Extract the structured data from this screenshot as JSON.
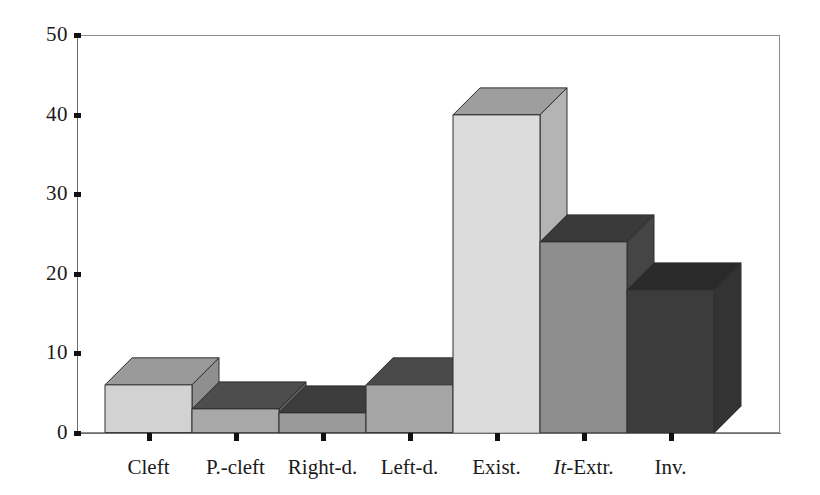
{
  "chart_data": {
    "type": "bar",
    "title": "",
    "subtitle": "",
    "xlabel": "",
    "ylabel": "",
    "ylim": [
      0,
      50
    ],
    "y_ticks": [
      0,
      10,
      20,
      30,
      40,
      50
    ],
    "grid": false,
    "legend": null,
    "style": "3d-block-bars",
    "categories": [
      "Cleft",
      "P.-cleft",
      "Right-d.",
      "Left-d.",
      "Exist.",
      "It-Extr.",
      "Inv."
    ],
    "values": [
      6,
      3,
      2.5,
      6,
      40,
      24,
      18
    ],
    "back_edge_values": [
      9.5,
      6,
      5.5,
      9.5,
      43,
      27,
      21
    ],
    "series": [
      {
        "name": "frequency",
        "values": [
          6,
          3,
          2.5,
          6,
          40,
          24,
          18
        ]
      }
    ],
    "bars": [
      {
        "label": "Cleft",
        "label_html": "Cleft",
        "value": 6,
        "back_value": 9.5,
        "front_color": "#d2d2d2",
        "top_color": "#9a9a9a",
        "side_color": "#8f8f8f"
      },
      {
        "label": "P.-cleft",
        "label_html": "P.-cleft",
        "value": 3,
        "back_value": 6,
        "front_color": "#a8a8a8",
        "top_color": "#4d4d4d",
        "side_color": "#5a5a5a"
      },
      {
        "label": "Right-d.",
        "label_html": "Right-d.",
        "value": 2.5,
        "back_value": 5.5,
        "front_color": "#9a9a9a",
        "top_color": "#3c3c3c",
        "side_color": "#4a4a4a"
      },
      {
        "label": "Left-d.",
        "label_html": "Left-d.",
        "value": 6,
        "back_value": 9.5,
        "front_color": "#a5a5a5",
        "top_color": "#4a4a4a",
        "side_color": "#585858"
      },
      {
        "label": "Exist.",
        "label_html": "Exist.",
        "value": 40,
        "back_value": 43,
        "front_color": "#dcdcdc",
        "top_color": "#9e9e9e",
        "side_color": "#b4b4b4"
      },
      {
        "label": "It-Extr.",
        "label_html": "<i>It</i>-Extr.",
        "value": 24,
        "back_value": 27,
        "front_color": "#8e8e8e",
        "top_color": "#3a3a3a",
        "side_color": "#454545"
      },
      {
        "label": "Inv.",
        "label_html": "Inv.",
        "value": 18,
        "back_value": 21,
        "front_color": "#3c3c3c",
        "top_color": "#2a2a2a",
        "side_color": "#333333"
      }
    ],
    "colors": {
      "axis": "#6e6e6e",
      "frame": "#8a8a8a",
      "tick": "#111111",
      "text": "#1a1a1a",
      "background": "#ffffff"
    }
  }
}
